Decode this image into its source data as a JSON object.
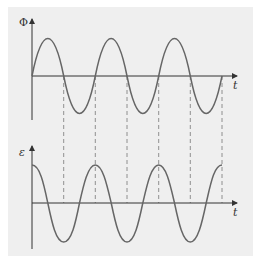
{
  "diagram": {
    "top_graph": {
      "y_label": "Φ",
      "x_label": "t",
      "curve": "sine",
      "cycles": 3
    },
    "bottom_graph": {
      "y_label": "ε",
      "x_label": "t",
      "curve": "cosine",
      "cycles": 3
    },
    "dashed_guides": "vertical lines linking zero crossings of Φ to peaks/troughs of ε",
    "colors": {
      "background": "#efefef",
      "curve": "#666666",
      "axis": "#333333",
      "dashed": "#777777"
    }
  }
}
